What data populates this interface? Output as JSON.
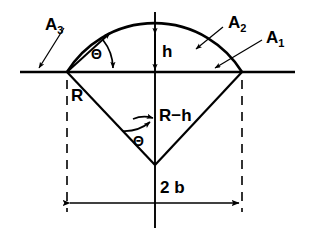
{
  "figure": {
    "type": "geometric-diagram",
    "background_color": "#ffffff",
    "stroke_color": "#000000",
    "labels": {
      "area_left": {
        "text": "A",
        "sub": "3"
      },
      "area_arc": {
        "text": "A",
        "sub": "2"
      },
      "area_right": {
        "text": "A",
        "sub": "1"
      },
      "height": "h",
      "radius": "R",
      "apothem": "R−h",
      "chord": "2 b",
      "angle_top": "Θ",
      "angle_bottom": "Θ"
    },
    "geometry": {
      "left_vertex": [
        67,
        72
      ],
      "right_vertex": [
        242,
        72
      ],
      "apex": [
        155,
        165
      ],
      "arc_top": [
        155,
        32
      ],
      "axis_y": 72,
      "axis_x_start": 20,
      "axis_x_end": 295,
      "centerline_top": 12,
      "centerline_bottom": 228,
      "dimension_line_y": 203
    }
  }
}
